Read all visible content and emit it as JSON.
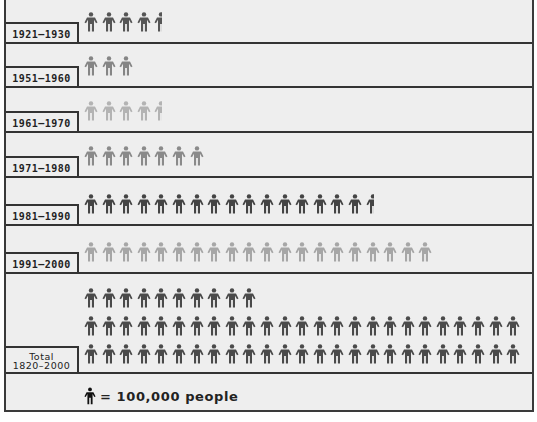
{
  "chart_data": {
    "type": "pictograph",
    "title": "",
    "unit": "100,000 people per icon",
    "categories": [
      "1921–1930",
      "1951–1960",
      "1961–1970",
      "1971–1980",
      "1981–1990",
      "1991–2000",
      "Total 1820–2000"
    ],
    "values_icons": [
      4.4,
      3,
      4.4,
      7,
      16.4,
      20,
      60
    ],
    "values_people": [
      440000,
      300000,
      440000,
      700000,
      1640000,
      2000000,
      6000000
    ],
    "colors": [
      "#555555",
      "#888888",
      "#b0b0b0",
      "#888888",
      "#444444",
      "#a8a8a8",
      "#4a4a4a"
    ],
    "legend": {
      "icon": "person-icon",
      "text": "= 100,000 people"
    }
  },
  "rows": [
    {
      "label": "1921–1930",
      "full": 4,
      "partial": 0.4,
      "color": "#555555"
    },
    {
      "label": "1951–1960",
      "full": 3,
      "partial": 0,
      "color": "#858585"
    },
    {
      "label": "1961–1970",
      "full": 4,
      "partial": 0.4,
      "color": "#b3b3b3"
    },
    {
      "label": "1971–1980",
      "full": 7,
      "partial": 0,
      "color": "#8a8a8a"
    },
    {
      "label": "1981–1990",
      "full": 16,
      "partial": 0.4,
      "color": "#444444"
    },
    {
      "label": "1991–2000",
      "full": 20,
      "partial": 0,
      "color": "#a6a6a6"
    }
  ],
  "total": {
    "label_line1": "Total",
    "label_line2": "1820–2000",
    "rows": [
      10,
      25,
      25
    ],
    "color": "#4a4a4a"
  },
  "legend": {
    "text": "= 100,000 people"
  }
}
